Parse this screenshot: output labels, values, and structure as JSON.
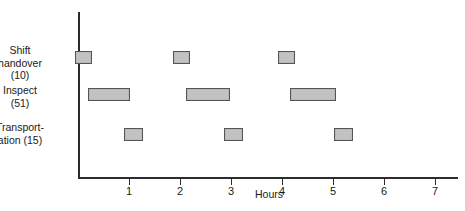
{
  "chart_data": {
    "type": "bar",
    "title": "",
    "subtitle": "",
    "xlabel": "Hours",
    "ylabel": "",
    "orientation": "horizontal",
    "grid": false,
    "legend": null,
    "xlim": [
      0,
      7.45
    ],
    "x_ticks": [
      1,
      2,
      3,
      4,
      5,
      6,
      7
    ],
    "x_tick_labels": [
      "1",
      "2",
      "3",
      "4",
      "5",
      "6",
      "7"
    ],
    "categories": [
      "Shift\nhandover\n(10)",
      "Inspect\n(51)",
      "Transport-\nation  (15)"
    ],
    "category_names": [
      "Shift handover",
      "Inspect",
      "Transportation"
    ],
    "category_values": [
      10,
      51,
      15
    ],
    "series": [
      {
        "name": "Shift handover",
        "value": 10,
        "intervals": [
          {
            "start": -0.05,
            "end": 0.27
          },
          {
            "start": 1.86,
            "end": 2.19
          },
          {
            "start": 3.92,
            "end": 4.25
          }
        ]
      },
      {
        "name": "Inspect",
        "value": 51,
        "intervals": [
          {
            "start": 0.2,
            "end": 1.02
          },
          {
            "start": 2.12,
            "end": 2.98
          },
          {
            "start": 4.16,
            "end": 5.06
          }
        ]
      },
      {
        "name": "Transportation",
        "value": 15,
        "intervals": [
          {
            "start": 0.9,
            "end": 1.27
          },
          {
            "start": 2.86,
            "end": 3.23
          },
          {
            "start": 5.02,
            "end": 5.39
          }
        ]
      }
    ]
  },
  "axis": {
    "x_title": "Hours",
    "ticks": [
      "1",
      "2",
      "3",
      "4",
      "5",
      "6",
      "7"
    ]
  },
  "labels": {
    "row0": "Shift\nhandover\n(10)",
    "row1": "Inspect\n(51)",
    "row2": "Transport-\nation  (15)"
  },
  "colors": {
    "bar_fill": "#c2c2c2",
    "bar_stroke": "#555555",
    "axis": "#2b2b2b",
    "text": "#1a1a1a",
    "background": "#ffffff"
  }
}
